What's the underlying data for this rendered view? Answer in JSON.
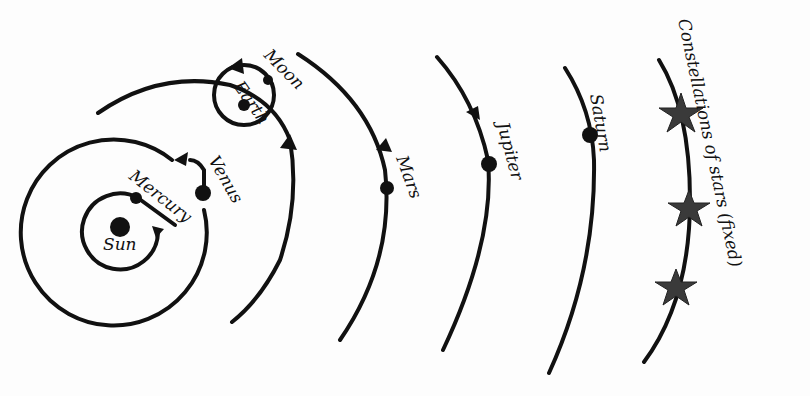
{
  "diagram": {
    "type": "heliocentric-solar-system",
    "labels": {
      "sun": "Sun",
      "mercury": "Mercury",
      "venus": "Venus",
      "earth": "Earth",
      "moon": "Moon",
      "mars": "Mars",
      "jupiter": "Jupiter",
      "saturn": "Saturn",
      "stars": "Constellations of stars (fixed)"
    },
    "colors": {
      "line": "#111111",
      "star": "#3a3a3a",
      "background": "#fdfdfd"
    }
  }
}
